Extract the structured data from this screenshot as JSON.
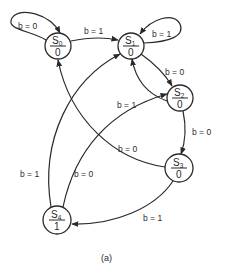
{
  "diagram": {
    "type": "state-transition-diagram",
    "caption": "(a)",
    "states": [
      {
        "id": "S0",
        "name": "S",
        "sub": "0",
        "output": "0"
      },
      {
        "id": "S1",
        "name": "S",
        "sub": "1",
        "output": "0"
      },
      {
        "id": "S2",
        "name": "S",
        "sub": "2",
        "output": "0"
      },
      {
        "id": "S3",
        "name": "S",
        "sub": "3",
        "output": "0"
      },
      {
        "id": "S4",
        "name": "S",
        "sub": "4",
        "output": "1"
      }
    ],
    "transitions": [
      {
        "from": "S0",
        "to": "S0",
        "label": "b = 0"
      },
      {
        "from": "S0",
        "to": "S1",
        "label": "b = 1"
      },
      {
        "from": "S1",
        "to": "S1",
        "label": "b = 1"
      },
      {
        "from": "S1",
        "to": "S2",
        "label": "b = 0"
      },
      {
        "from": "S2",
        "to": "S1",
        "label": "b = 1"
      },
      {
        "from": "S2",
        "to": "S3",
        "label": "b = 0"
      },
      {
        "from": "S3",
        "to": "S0",
        "label": "b = 0"
      },
      {
        "from": "S3",
        "to": "S4",
        "label": "b = 1"
      },
      {
        "from": "S4",
        "to": "S1",
        "label": "b = 1"
      },
      {
        "from": "S4",
        "to": "S2",
        "label": "b = 0"
      }
    ]
  }
}
